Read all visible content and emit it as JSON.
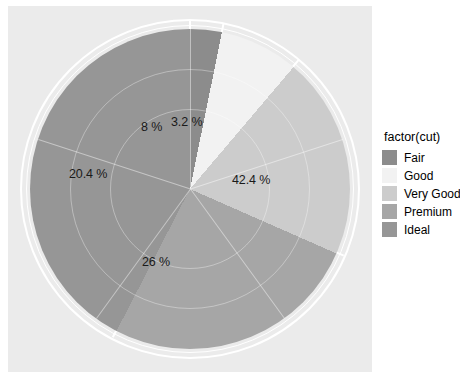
{
  "chart_data": {
    "type": "pie",
    "title": "",
    "xlabel": "",
    "ylabel": "",
    "categories": [
      "Fair",
      "Good",
      "Very Good",
      "Premium",
      "Ideal"
    ],
    "values": [
      3.2,
      8,
      20.4,
      26,
      42.4
    ],
    "value_labels": [
      "3.2 %",
      "8 %",
      "20.4 %",
      "26 %",
      "42.4 %"
    ],
    "colors": [
      "#8c8c8c",
      "#f2f2f2",
      "#cccccc",
      "#a6a6a6",
      "#969696"
    ],
    "legend_position": "right",
    "grid": true,
    "units": "percent",
    "panel_background": "#ebebeb",
    "grid_color": "#ffffff"
  },
  "legend": {
    "title": "factor(cut)",
    "items": [
      {
        "label": "Fair",
        "color": "#8c8c8c"
      },
      {
        "label": "Good",
        "color": "#f2f2f2"
      },
      {
        "label": "Very Good",
        "color": "#cccccc"
      },
      {
        "label": "Premium",
        "color": "#a6a6a6"
      },
      {
        "label": "Ideal",
        "color": "#969696"
      }
    ]
  },
  "slice_labels": [
    {
      "text": "42.4 %",
      "category": "Ideal"
    },
    {
      "text": "26 %",
      "category": "Premium"
    },
    {
      "text": "20.4 %",
      "category": "Very Good"
    },
    {
      "text": "8 %",
      "category": "Good"
    },
    {
      "text": "3.2 %",
      "category": "Fair"
    }
  ]
}
